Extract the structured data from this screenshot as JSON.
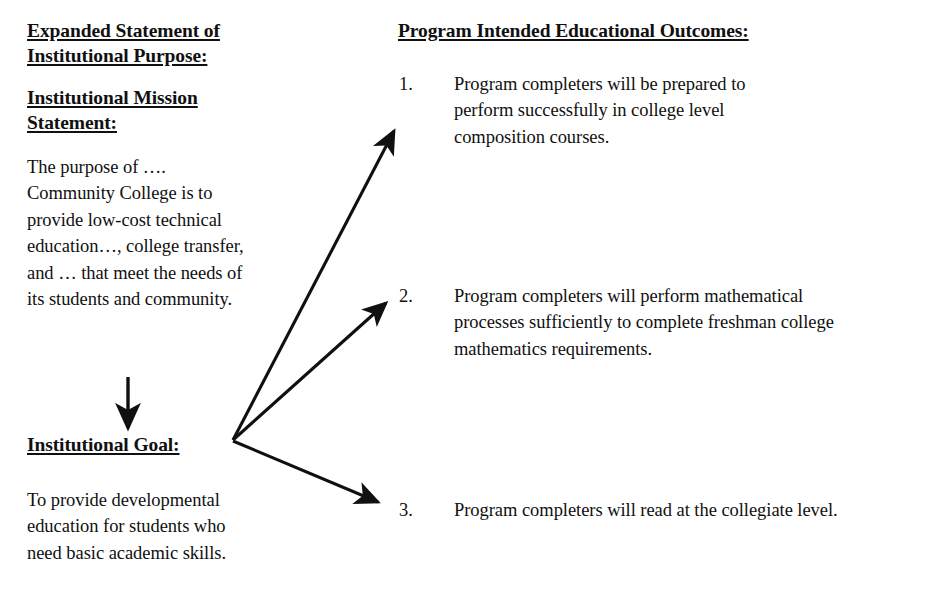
{
  "document": {
    "background_color": "#ffffff",
    "ink_color": "#101010"
  },
  "left_column": {
    "purpose_heading": {
      "line_1": "Expanded Statement of",
      "line_2": "Institutional Purpose:"
    },
    "mission_heading": {
      "line_1": "Institutional Mission",
      "line_2": "Statement:"
    },
    "mission_body": "The purpose of …. Community College is to provide low-cost technical education…, college transfer, and … that meet the needs of its students and community.",
    "goal_heading": "Institutional Goal:",
    "goal_body": "To provide developmental education for students who need basic academic skills."
  },
  "right_column": {
    "outcomes_heading": "Program Intended Educational Outcomes:",
    "outcomes": [
      {
        "number": "1.",
        "text": "Program completers will be prepared to perform successfully in college level composition courses."
      },
      {
        "number": "2.",
        "text": "Program completers will perform mathematical processes sufficiently to complete freshman college mathematics requirements."
      },
      {
        "number": "3.",
        "text": "Program completers will read at the collegiate level."
      }
    ]
  },
  "connectors": {
    "mission_to_goal_arrow": "down-arrow-icon",
    "goal_to_outcome_1_arrow": "diagonal-up-arrow-icon",
    "goal_to_outcome_2_arrow": "diagonal-up-arrow-icon",
    "goal_to_outcome_3_arrow": "diagonal-down-arrow-icon"
  }
}
